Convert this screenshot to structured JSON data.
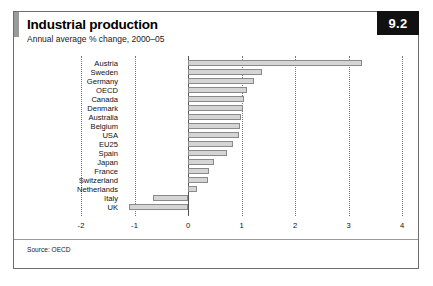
{
  "header": {
    "title": "Industrial production",
    "subtitle": "Annual average % change, 2000–05",
    "badge": "9.2"
  },
  "footer": {
    "source": "Source: OECD"
  },
  "chart_data": {
    "type": "bar",
    "orientation": "horizontal",
    "title": "Industrial production",
    "subtitle": "Annual average % change, 2000–05",
    "xlabel": "",
    "ylabel": "",
    "xlim": [
      -2,
      4
    ],
    "ticks": [
      "-2",
      "-1",
      "0",
      "1",
      "2",
      "3",
      "4"
    ],
    "tick_values": [
      -2,
      -1,
      0,
      1,
      2,
      3,
      4
    ],
    "grid": true,
    "legend": null,
    "bar_color": "#d5d5d5",
    "bar_border_color": "#8a8a8a",
    "categories": [
      "Austria",
      "Sweden",
      "Germany",
      "OECD",
      "Canada",
      "Denmark",
      "Australia",
      "Belgium",
      "USA",
      "EU25",
      "Spain",
      "Japan",
      "France",
      "Switzerland",
      "Netherlands",
      "Italy",
      "UK"
    ],
    "values": [
      3.25,
      1.38,
      1.23,
      1.1,
      1.05,
      1.03,
      0.99,
      0.97,
      0.95,
      0.84,
      0.73,
      0.49,
      0.39,
      0.37,
      0.17,
      -0.65,
      -1.1
    ]
  }
}
